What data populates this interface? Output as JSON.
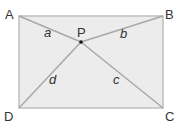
{
  "diagram": {
    "type": "rectangle-with-interior-point",
    "colors": {
      "fill": "#ececec",
      "edge": "#bfbfbf",
      "segment": "#a8a8a8",
      "text": "#333333",
      "point": "#111111"
    },
    "vertices": [
      {
        "label": "A",
        "x": 19,
        "y": 16
      },
      {
        "label": "B",
        "x": 163,
        "y": 16
      },
      {
        "label": "C",
        "x": 163,
        "y": 108
      },
      {
        "label": "D",
        "x": 19,
        "y": 108
      }
    ],
    "point": {
      "label": "P",
      "x": 81,
      "y": 42
    },
    "segments": [
      {
        "from": "A",
        "to": "P",
        "label": "a"
      },
      {
        "from": "B",
        "to": "P",
        "label": "b"
      },
      {
        "from": "C",
        "to": "P",
        "label": "c"
      },
      {
        "from": "D",
        "to": "P",
        "label": "d"
      }
    ]
  }
}
